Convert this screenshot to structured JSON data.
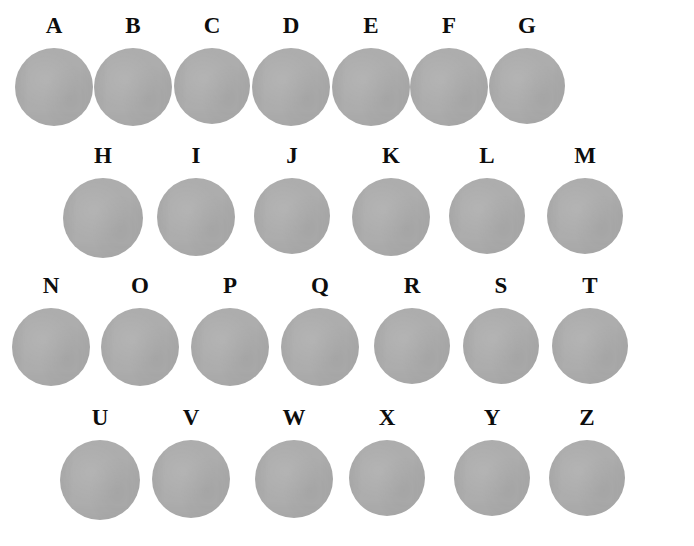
{
  "figure": {
    "width": 694,
    "height": 546,
    "background_color": "#ffffff",
    "disc_color": "#adadad",
    "label_color": "#0d0d0d"
  },
  "rows": [
    {
      "row_index": 1,
      "label_baseline_y": 36,
      "disc_top_y": 48,
      "items": [
        {
          "label": "A",
          "center_x": 54,
          "diameter": 78
        },
        {
          "label": "B",
          "center_x": 133,
          "diameter": 78
        },
        {
          "label": "C",
          "center_x": 212,
          "diameter": 76
        },
        {
          "label": "D",
          "center_x": 291,
          "diameter": 78
        },
        {
          "label": "E",
          "center_x": 371,
          "diameter": 78
        },
        {
          "label": "F",
          "center_x": 449,
          "diameter": 78
        },
        {
          "label": "G",
          "center_x": 527,
          "diameter": 76
        }
      ]
    },
    {
      "row_index": 2,
      "label_baseline_y": 166,
      "disc_top_y": 178,
      "items": [
        {
          "label": "H",
          "center_x": 103,
          "diameter": 80
        },
        {
          "label": "I",
          "center_x": 196,
          "diameter": 78
        },
        {
          "label": "J",
          "center_x": 292,
          "diameter": 76
        },
        {
          "label": "K",
          "center_x": 391,
          "diameter": 78
        },
        {
          "label": "L",
          "center_x": 487,
          "diameter": 76
        },
        {
          "label": "M",
          "center_x": 585,
          "diameter": 76
        }
      ]
    },
    {
      "row_index": 3,
      "label_baseline_y": 296,
      "disc_top_y": 308,
      "items": [
        {
          "label": "N",
          "center_x": 51,
          "diameter": 78
        },
        {
          "label": "O",
          "center_x": 140,
          "diameter": 78
        },
        {
          "label": "P",
          "center_x": 230,
          "diameter": 78
        },
        {
          "label": "Q",
          "center_x": 320,
          "diameter": 78
        },
        {
          "label": "R",
          "center_x": 412,
          "diameter": 76
        },
        {
          "label": "S",
          "center_x": 501,
          "diameter": 76
        },
        {
          "label": "T",
          "center_x": 590,
          "diameter": 76
        }
      ]
    },
    {
      "row_index": 4,
      "label_baseline_y": 428,
      "disc_top_y": 440,
      "items": [
        {
          "label": "U",
          "center_x": 100,
          "diameter": 80
        },
        {
          "label": "V",
          "center_x": 191,
          "diameter": 78
        },
        {
          "label": "W",
          "center_x": 294,
          "diameter": 78
        },
        {
          "label": "X",
          "center_x": 387,
          "diameter": 76
        },
        {
          "label": "Y",
          "center_x": 492,
          "diameter": 76
        },
        {
          "label": "Z",
          "center_x": 587,
          "diameter": 76
        }
      ]
    }
  ]
}
